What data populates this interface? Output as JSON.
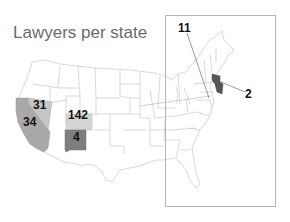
{
  "title": "Lawyers per state",
  "colors": {
    "background": "#ffffff",
    "state_border": "#c8c8c8",
    "inset_border": "#b5b5b5",
    "california": "#a9a9a9",
    "nevada": "#c6c6c6",
    "colorado": "#d4d4d4",
    "new_mexico": "#7e7e7e",
    "new_jersey": "#555555",
    "label": "#111111",
    "title": "#6b6b6b"
  },
  "states": [
    {
      "name": "Nevada",
      "value": "31"
    },
    {
      "name": "California",
      "value": "34"
    },
    {
      "name": "Colorado",
      "value": "142"
    },
    {
      "name": "New Mexico",
      "value": "4"
    },
    {
      "name": "Delaware/Maryland",
      "value": "11"
    },
    {
      "name": "New Jersey",
      "value": "2"
    }
  ],
  "inset": {
    "region": "Northeast"
  }
}
